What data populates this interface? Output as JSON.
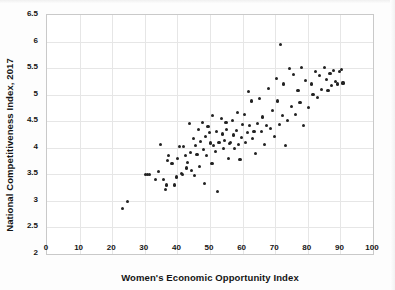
{
  "chart_data": {
    "type": "scatter",
    "title": "",
    "xlabel": "Women's Economic Opportunity Index",
    "ylabel": "National Competitiveness Index, 2017",
    "xlim": [
      0,
      100
    ],
    "ylim": [
      2,
      6.5
    ],
    "xticks": [
      0,
      10,
      20,
      30,
      40,
      50,
      60,
      70,
      80,
      90,
      100
    ],
    "yticks": [
      2,
      2.5,
      3,
      3.5,
      4,
      4.5,
      5,
      5.5,
      6,
      6.5
    ],
    "grid": true,
    "legend": false,
    "marker_color": "#222222",
    "points": [
      [
        23.2,
        2.85
      ],
      [
        24.8,
        2.98
      ],
      [
        30.2,
        3.5
      ],
      [
        30.8,
        3.5
      ],
      [
        31.5,
        3.5
      ],
      [
        33.4,
        3.41
      ],
      [
        34.2,
        3.56
      ],
      [
        34.8,
        4.06
      ],
      [
        35.6,
        3.4
      ],
      [
        36.3,
        3.22
      ],
      [
        36.6,
        3.3
      ],
      [
        36.9,
        3.76
      ],
      [
        37.4,
        3.85
      ],
      [
        38.2,
        3.7
      ],
      [
        38.6,
        3.71
      ],
      [
        39.2,
        3.3
      ],
      [
        39.8,
        3.45
      ],
      [
        40.1,
        3.79
      ],
      [
        40.6,
        4.02
      ],
      [
        41.2,
        3.52
      ],
      [
        41.6,
        3.5
      ],
      [
        42.0,
        4.02
      ],
      [
        42.4,
        3.86
      ],
      [
        42.8,
        3.62
      ],
      [
        43.1,
        3.73
      ],
      [
        43.6,
        4.46
      ],
      [
        44.0,
        3.91
      ],
      [
        44.4,
        3.57
      ],
      [
        44.8,
        4.17
      ],
      [
        45.2,
        3.47
      ],
      [
        45.6,
        4.04
      ],
      [
        46.0,
        3.88
      ],
      [
        46.4,
        4.35
      ],
      [
        46.8,
        3.64
      ],
      [
        47.2,
        4.12
      ],
      [
        47.6,
        4.48
      ],
      [
        48.0,
        3.96
      ],
      [
        48.2,
        3.33
      ],
      [
        48.6,
        4.22
      ],
      [
        49.0,
        3.86
      ],
      [
        49.4,
        4.4
      ],
      [
        49.8,
        4.28
      ],
      [
        50.2,
        4.09
      ],
      [
        50.6,
        3.7
      ],
      [
        50.9,
        4.6
      ],
      [
        51.2,
        4.05
      ],
      [
        51.6,
        3.93
      ],
      [
        52.0,
        4.3
      ],
      [
        52.3,
        3.18
      ],
      [
        52.6,
        4.1
      ],
      [
        53.0,
        4.1
      ],
      [
        53.4,
        4.55
      ],
      [
        53.8,
        4.26
      ],
      [
        54.1,
        3.98
      ],
      [
        54.5,
        4.14
      ],
      [
        54.9,
        4.48
      ],
      [
        55.2,
        4.35
      ],
      [
        55.6,
        3.8
      ],
      [
        56.0,
        4.08
      ],
      [
        56.4,
        4.1
      ],
      [
        56.8,
        4.52
      ],
      [
        57.2,
        4.24
      ],
      [
        57.6,
        3.99
      ],
      [
        58.0,
        4.33
      ],
      [
        58.4,
        4.66
      ],
      [
        58.8,
        4.06
      ],
      [
        59.2,
        3.78
      ],
      [
        59.6,
        4.2
      ],
      [
        60.1,
        4.44
      ],
      [
        60.5,
        4.62
      ],
      [
        61.0,
        4.1
      ],
      [
        61.4,
        4.29
      ],
      [
        61.8,
        5.06
      ],
      [
        62.2,
        4.42
      ],
      [
        62.6,
        4.88
      ],
      [
        63.0,
        4.17
      ],
      [
        63.5,
        4.3
      ],
      [
        64.0,
        3.9
      ],
      [
        64.6,
        4.46
      ],
      [
        65.2,
        4.92
      ],
      [
        65.8,
        4.3
      ],
      [
        66.2,
        4.58
      ],
      [
        66.8,
        4.06
      ],
      [
        67.4,
        4.42
      ],
      [
        68.0,
        5.12
      ],
      [
        68.6,
        4.36
      ],
      [
        69.2,
        4.7
      ],
      [
        69.8,
        4.22
      ],
      [
        70.4,
        5.3
      ],
      [
        70.8,
        4.88
      ],
      [
        71.2,
        4.44
      ],
      [
        71.6,
        5.95
      ],
      [
        72.2,
        4.6
      ],
      [
        72.6,
        5.2
      ],
      [
        73.2,
        4.04
      ],
      [
        73.8,
        4.52
      ],
      [
        74.4,
        5.5
      ],
      [
        75.0,
        4.78
      ],
      [
        75.6,
        5.38
      ],
      [
        76.2,
        4.62
      ],
      [
        77.0,
        5.08
      ],
      [
        77.6,
        4.86
      ],
      [
        78.2,
        5.52
      ],
      [
        78.8,
        4.42
      ],
      [
        79.4,
        5.26
      ],
      [
        80.2,
        4.76
      ],
      [
        81.0,
        5.2
      ],
      [
        81.6,
        5.0
      ],
      [
        82.4,
        5.44
      ],
      [
        83.0,
        4.94
      ],
      [
        83.6,
        5.36
      ],
      [
        84.2,
        5.1
      ],
      [
        85.0,
        5.52
      ],
      [
        85.6,
        5.28
      ],
      [
        86.2,
        5.08
      ],
      [
        86.8,
        5.4
      ],
      [
        87.4,
        5.18
      ],
      [
        88.0,
        5.46
      ],
      [
        88.6,
        5.24
      ],
      [
        89.2,
        5.2
      ],
      [
        89.8,
        5.44
      ],
      [
        90.4,
        5.48
      ],
      [
        90.8,
        5.22
      ]
    ]
  },
  "axes": {
    "x_title": "Women's Economic Opportunity Index",
    "y_title": "National Competitiveness Index, 2017",
    "x_tick_labels": [
      "0",
      "10",
      "20",
      "30",
      "40",
      "50",
      "60",
      "70",
      "80",
      "90",
      "100"
    ],
    "y_tick_labels": [
      "2",
      "2.5",
      "3",
      "3.5",
      "4",
      "4.5",
      "5",
      "5.5",
      "6",
      "6.5"
    ]
  }
}
